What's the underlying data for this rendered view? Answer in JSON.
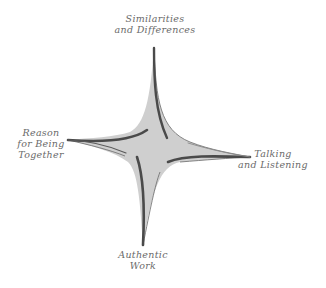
{
  "diagram": {
    "type": "four-point-star",
    "colors": {
      "fill": "#cfcfcf",
      "stroke": "#4a4a4a",
      "text": "#6a6a6a",
      "background": "#ffffff"
    },
    "points": {
      "top": {
        "lines": [
          "Similarities",
          "and Differences"
        ]
      },
      "right": {
        "lines": [
          "Talking",
          "and Listening"
        ]
      },
      "bottom": {
        "lines": [
          "Authentic",
          "Work"
        ]
      },
      "left": {
        "lines": [
          "Reason",
          "for Being",
          "Together"
        ]
      }
    }
  }
}
